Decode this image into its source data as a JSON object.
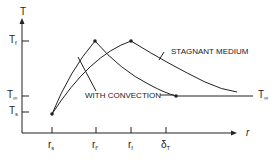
{
  "diagram": {
    "axes": {
      "y_label": "T",
      "x_label": "r"
    },
    "y_ticks": [
      {
        "base": "T",
        "sub": "f",
        "name": "T_f"
      },
      {
        "base": "T",
        "sub": "∞",
        "name": "T_inf"
      },
      {
        "base": "T",
        "sub": "s",
        "name": "T_s"
      }
    ],
    "x_ticks": [
      {
        "base": "r",
        "sub": "s",
        "name": "r_s"
      },
      {
        "base": "r",
        "sub": "f′",
        "name": "r_f_prime"
      },
      {
        "base": "r",
        "sub": "f",
        "name": "r_f"
      },
      {
        "base": "δ",
        "sub": "T",
        "name": "delta_T"
      }
    ],
    "curves": [
      {
        "label": "STAGNANT MEDIUM",
        "peak": "r_f"
      },
      {
        "label": "WITH CONVECTION",
        "peak": "r_f_prime"
      }
    ],
    "right_label": {
      "base": "T",
      "sub": "∞"
    },
    "colors": {
      "line": "#222222",
      "background": "#ffffff"
    }
  }
}
